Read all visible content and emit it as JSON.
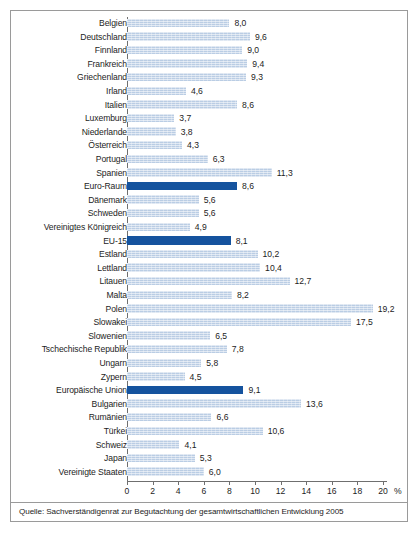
{
  "chart_data": {
    "type": "bar",
    "orientation": "horizontal",
    "title": "",
    "xlabel": "%",
    "ylabel": "",
    "xlim": [
      0,
      20
    ],
    "xticks": [
      0,
      2,
      4,
      6,
      8,
      10,
      12,
      14,
      16,
      18,
      20
    ],
    "grid": false,
    "legend": null,
    "unit_label": "%",
    "source": "Quelle: Sachverständigenrat zur Begutachtung der gesamtwirtschaftlichen Entwicklung 2005",
    "colors": {
      "bar": "#bacde4",
      "bar_highlight": "#15539e",
      "axis": "#6f6f6f",
      "text": "#1d1d1d",
      "border": "#9a9a9a"
    },
    "categories": [
      "Belgien",
      "Deutschland",
      "Finnland",
      "Frankreich",
      "Griechenland",
      "Irland",
      "Italien",
      "Luxemburg",
      "Niederlande",
      "Österreich",
      "Portugal",
      "Spanien",
      "Euro-Raum",
      "Dänemark",
      "Schweden",
      "Vereinigtes Königreich",
      "EU-15",
      "Estland",
      "Lettland",
      "Litauen",
      "Malta",
      "Polen",
      "Slowakei",
      "Slowenien",
      "Tschechische Republik",
      "Ungarn",
      "Zypern",
      "Europäische Union",
      "Bulgarien",
      "Rumänien",
      "Türkei",
      "Schweiz",
      "Japan",
      "Vereinigte Staaten"
    ],
    "values": [
      8.0,
      9.6,
      9.0,
      9.4,
      9.3,
      4.6,
      8.6,
      3.7,
      3.8,
      4.3,
      6.3,
      11.3,
      8.6,
      5.6,
      5.6,
      4.9,
      8.1,
      10.2,
      10.4,
      12.7,
      8.2,
      19.2,
      17.5,
      6.5,
      7.8,
      5.8,
      4.5,
      9.1,
      13.6,
      6.6,
      10.6,
      4.1,
      5.3,
      6.0
    ],
    "value_labels": [
      "8,0",
      "9,6",
      "9,0",
      "9,4",
      "9,3",
      "4,6",
      "8,6",
      "3,7",
      "3,8",
      "4,3",
      "6,3",
      "11,3",
      "8,6",
      "5,6",
      "5,6",
      "4,9",
      "8,1",
      "10,2",
      "10,4",
      "12,7",
      "8,2",
      "19,2",
      "17,5",
      "6,5",
      "7,8",
      "5,8",
      "4,5",
      "9,1",
      "13,6",
      "6,6",
      "10,6",
      "4,1",
      "5,3",
      "6,0"
    ],
    "highlighted": [
      false,
      false,
      false,
      false,
      false,
      false,
      false,
      false,
      false,
      false,
      false,
      false,
      true,
      false,
      false,
      false,
      true,
      false,
      false,
      false,
      false,
      false,
      false,
      false,
      false,
      false,
      false,
      true,
      false,
      false,
      false,
      false,
      false,
      false
    ]
  }
}
